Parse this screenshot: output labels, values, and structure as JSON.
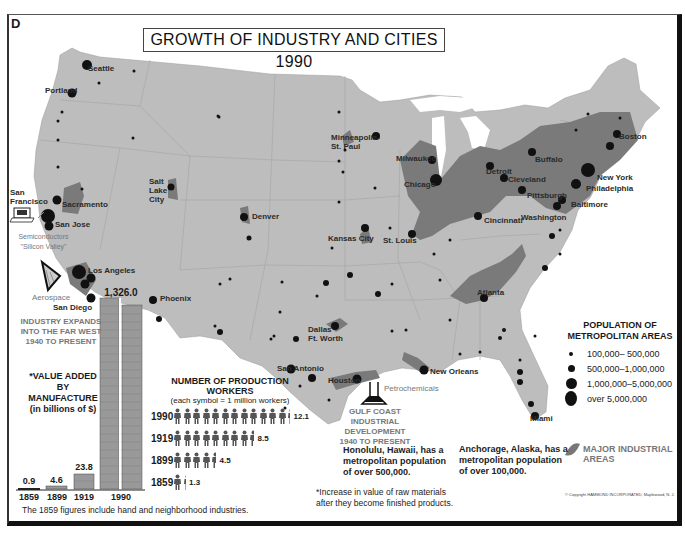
{
  "panel_letter": "D",
  "title": "GROWTH OF INDUSTRY AND CITIES  1990",
  "colors": {
    "land": "#bdbdbd",
    "industrial": "#777777",
    "city": "#111111",
    "water": "#ffffff",
    "label_gray": "#777777"
  },
  "cities": [
    {
      "name": "Seattle",
      "x": 88,
      "y": 64
    },
    {
      "name": "Portland",
      "x": 45,
      "y": 86
    },
    {
      "name": "San\nFrancisco",
      "x": 10,
      "y": 188
    },
    {
      "name": "Sacramento",
      "x": 62,
      "y": 200
    },
    {
      "name": "San Jose",
      "x": 55,
      "y": 220
    },
    {
      "name": "Los Angeles",
      "x": 88,
      "y": 266
    },
    {
      "name": "San Diego",
      "x": 53,
      "y": 303
    },
    {
      "name": "Phoenix",
      "x": 160,
      "y": 294
    },
    {
      "name": "Salt\nLake\nCity",
      "x": 149,
      "y": 177
    },
    {
      "name": "Denver",
      "x": 252,
      "y": 212
    },
    {
      "name": "Minneapolis-\nSt. Paul",
      "x": 331,
      "y": 133
    },
    {
      "name": "Kansas City",
      "x": 328,
      "y": 234
    },
    {
      "name": "St. Louis",
      "x": 383,
      "y": 236
    },
    {
      "name": "Milwaukee",
      "x": 396,
      "y": 154
    },
    {
      "name": "Chicago",
      "x": 404,
      "y": 180
    },
    {
      "name": "Detroit",
      "x": 486,
      "y": 167
    },
    {
      "name": "Cleveland",
      "x": 508,
      "y": 175
    },
    {
      "name": "Buffalo",
      "x": 535,
      "y": 155
    },
    {
      "name": "Pittsburgh",
      "x": 527,
      "y": 191
    },
    {
      "name": "Cincinnati",
      "x": 484,
      "y": 216
    },
    {
      "name": "Washington",
      "x": 521,
      "y": 213
    },
    {
      "name": "Baltimore",
      "x": 571,
      "y": 200
    },
    {
      "name": "Philadelphia",
      "x": 586,
      "y": 184
    },
    {
      "name": "New York",
      "x": 597,
      "y": 173
    },
    {
      "name": "Boston",
      "x": 619,
      "y": 132
    },
    {
      "name": "Dallas\nFt. Worth",
      "x": 308,
      "y": 325
    },
    {
      "name": "San Antonio",
      "x": 277,
      "y": 364
    },
    {
      "name": "Houston",
      "x": 328,
      "y": 376
    },
    {
      "name": "New Orleans",
      "x": 430,
      "y": 367
    },
    {
      "name": "Atlanta",
      "x": 477,
      "y": 288
    },
    {
      "name": "Miami",
      "x": 530,
      "y": 414
    }
  ],
  "annotations": {
    "silicon_valley": "Semiconductors\n\"Silicon Valley\"",
    "aerospace": "Aerospace",
    "far_west": "INDUSTRY EXPANDS\nINTO THE FAR WEST\n1940 TO PRESENT",
    "petrochemicals": "Petrochemicals",
    "gulf_coast": "GULF COAST INDUSTRIAL\nDEVELOPMENT\n1940 TO PRESENT",
    "honolulu": "Honolulu, Hawaii, has a\nmetropolitan population\nof over 500,000.",
    "anchorage": "Anchorage, Alaska, has a\nmetropolitan population\nof over 100,000.",
    "raw_materials": "*Increase in value of raw materials\nafter they become finished products.",
    "footnote_1859": "The 1859 figures include hand and neighborhood industries.",
    "copyright": "© Copyright HAMMOND INCORPORATED, Maplewood, N. J."
  },
  "legend": {
    "title": "POPULATION OF\nMETROPOLITAN AREAS",
    "items": [
      {
        "label": "100,000–  500,000",
        "size": 4
      },
      {
        "label": "500,000–1,000,000",
        "size": 7
      },
      {
        "label": "1,000,000–5,000,000",
        "size": 11
      },
      {
        "label": "over 5,000,000",
        "size": 15
      }
    ],
    "industrial_label": "MAJOR INDUSTRIAL\nAREAS"
  },
  "chart_data": [
    {
      "type": "bar",
      "title": "*VALUE ADDED BY MANUFACTURE (in billions of $)",
      "categories": [
        "1859",
        "1899",
        "1919",
        "1990"
      ],
      "values": [
        0.9,
        4.6,
        23.8,
        1326.0
      ],
      "value_labels": [
        "0.9",
        "4.6",
        "23.8",
        "1,326.0"
      ],
      "xlabel": "",
      "ylabel": "billions of $"
    },
    {
      "type": "pictogram",
      "title": "NUMBER OF PRODUCTION WORKERS",
      "subtitle": "(each symbol = 1 million workers)",
      "categories": [
        "1990",
        "1919",
        "1899",
        "1859"
      ],
      "values": [
        12.1,
        8.5,
        4.5,
        1.3
      ],
      "value_labels": [
        "12.1",
        "8.5",
        "4.5",
        "1.3"
      ]
    }
  ]
}
